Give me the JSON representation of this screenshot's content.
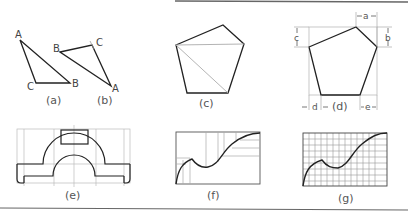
{
  "figure": {
    "panels": [
      {
        "id": "a",
        "caption": "(a)",
        "vertex_labels": [
          "A",
          "B",
          "C"
        ]
      },
      {
        "id": "b",
        "caption": "(b)",
        "vertex_labels": [
          "A",
          "B",
          "C"
        ]
      },
      {
        "id": "c",
        "caption": "(c)"
      },
      {
        "id": "d",
        "caption": "(d)",
        "dimension_labels": [
          "a",
          "b",
          "c",
          "d",
          "e"
        ]
      },
      {
        "id": "e",
        "caption": "(e)"
      },
      {
        "id": "f",
        "caption": "(f)"
      },
      {
        "id": "g",
        "caption": "(g)"
      }
    ],
    "colors": {
      "stroke": "#222222",
      "construction": "#b8b8b8",
      "label": "#555555"
    }
  }
}
